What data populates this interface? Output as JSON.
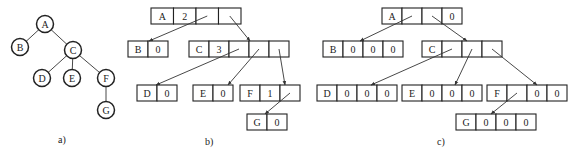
{
  "figure": {
    "panels": [
      {
        "id": "a",
        "caption": "a)",
        "kind": "tree",
        "nodes": [
          "A",
          "B",
          "C",
          "D",
          "E",
          "F",
          "G"
        ],
        "edges": [
          [
            "A",
            "B"
          ],
          [
            "A",
            "C"
          ],
          [
            "C",
            "D"
          ],
          [
            "C",
            "E"
          ],
          [
            "C",
            "F"
          ],
          [
            "F",
            "G"
          ]
        ]
      },
      {
        "id": "b",
        "caption": "b)",
        "kind": "variable-degree-linked",
        "records": [
          {
            "node": "A",
            "cells": [
              "A",
              "2",
              "",
              ""
            ]
          },
          {
            "node": "B",
            "cells": [
              "B",
              "0"
            ]
          },
          {
            "node": "C",
            "cells": [
              "C",
              "3",
              "",
              "",
              ""
            ]
          },
          {
            "node": "D",
            "cells": [
              "D",
              "0"
            ]
          },
          {
            "node": "E",
            "cells": [
              "E",
              "0"
            ]
          },
          {
            "node": "F",
            "cells": [
              "F",
              "1",
              ""
            ]
          },
          {
            "node": "G",
            "cells": [
              "G",
              "0"
            ]
          }
        ],
        "pointers": [
          [
            "A",
            "B"
          ],
          [
            "A",
            "C"
          ],
          [
            "C",
            "D"
          ],
          [
            "C",
            "E"
          ],
          [
            "C",
            "F"
          ],
          [
            "F",
            "G"
          ]
        ]
      },
      {
        "id": "c",
        "caption": "c)",
        "kind": "fixed-degree-linked",
        "records": [
          {
            "node": "A",
            "cells": [
              "A",
              "",
              "",
              "0"
            ]
          },
          {
            "node": "B",
            "cells": [
              "B",
              "0",
              "0",
              "0"
            ]
          },
          {
            "node": "C",
            "cells": [
              "C",
              "",
              "",
              ""
            ]
          },
          {
            "node": "D",
            "cells": [
              "D",
              "0",
              "0",
              "0"
            ]
          },
          {
            "node": "E",
            "cells": [
              "E",
              "0",
              "0",
              "0"
            ]
          },
          {
            "node": "F",
            "cells": [
              "F",
              "",
              "0",
              "0"
            ]
          },
          {
            "node": "G",
            "cells": [
              "G",
              "0",
              "0",
              "0"
            ]
          }
        ],
        "pointers": [
          [
            "A",
            "B"
          ],
          [
            "A",
            "C"
          ],
          [
            "C",
            "D"
          ],
          [
            "C",
            "E"
          ],
          [
            "C",
            "F"
          ],
          [
            "F",
            "G"
          ]
        ]
      }
    ]
  }
}
